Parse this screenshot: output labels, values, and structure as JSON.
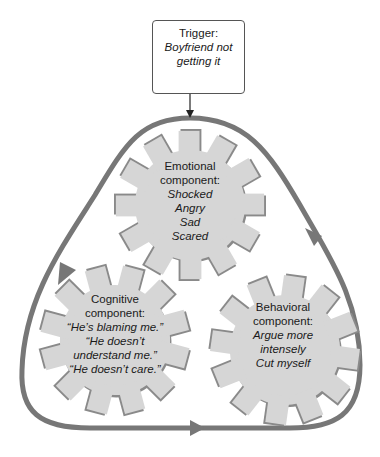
{
  "colors": {
    "loop": "#777777",
    "gear_fill": "#d6d6d6",
    "gear_shadow": "#8a8a8a",
    "text": "#1a1a1a",
    "box_border": "#555555"
  },
  "trigger": {
    "title": "Trigger:",
    "lines": [
      "Boyfriend not",
      "getting it"
    ]
  },
  "components": {
    "emotional": {
      "title_line1": "Emotional",
      "title_line2": "component:",
      "items": [
        "Shocked",
        "Angry",
        "Sad",
        "Scared"
      ]
    },
    "cognitive": {
      "title_line1": "Cognitive",
      "title_line2": "component:",
      "items": [
        "“He’s blaming me.”",
        "“He doesn’t",
        "understand me.”",
        "“He doesn’t care.”"
      ]
    },
    "behavioral": {
      "title_line1": "Behavioral",
      "title_line2": "component:",
      "items": [
        "Argue more",
        "intensely",
        "Cut myself"
      ]
    }
  },
  "cycle": {
    "arrows": [
      "left-down",
      "bottom-right",
      "right-up"
    ]
  }
}
